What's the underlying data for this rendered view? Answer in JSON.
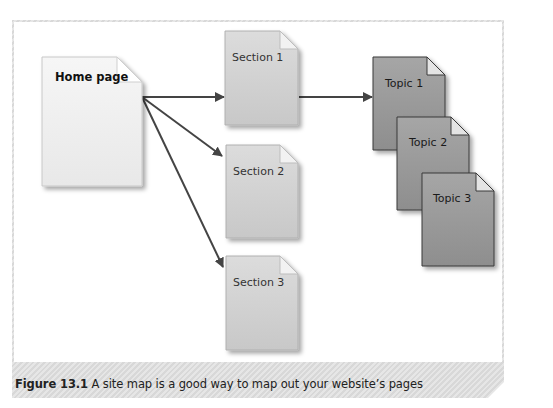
{
  "figure": {
    "caption_number": "Figure 13.1",
    "caption_text": "A site map is a good way to map out your website’s pages"
  },
  "colors": {
    "frame_hatch_dark": "#d8d8d8",
    "frame_hatch_light": "#e6e6e6",
    "home_fill": "#f0f0f0",
    "section_fill": "#d2d2d2",
    "topic_fill": "#9c9c9c",
    "arrow": "#444444"
  },
  "diagram": {
    "home": {
      "label": "Home page"
    },
    "sections": [
      {
        "label": "Section 1"
      },
      {
        "label": "Section 2"
      },
      {
        "label": "Section 3"
      }
    ],
    "topics": [
      {
        "label": "Topic 1"
      },
      {
        "label": "Topic 2"
      },
      {
        "label": "Topic 3"
      }
    ],
    "edges": [
      {
        "from": "Home page",
        "to": "Section 1"
      },
      {
        "from": "Home page",
        "to": "Section 2"
      },
      {
        "from": "Home page",
        "to": "Section 3"
      },
      {
        "from": "Section 1",
        "to": "Topic 1"
      }
    ]
  }
}
